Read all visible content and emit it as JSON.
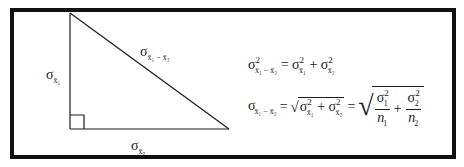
{
  "diagram": {
    "type": "right-triangle",
    "frame_color": "#111111",
    "line_color": "#1a1a1a",
    "vertices": {
      "top": [
        70,
        13
      ],
      "right_angle": [
        70,
        129
      ],
      "bottom_right": [
        229,
        129
      ]
    },
    "labels": {
      "vertical_leg": {
        "symbol": "σ",
        "subscript": "x̄₁",
        "text": "σx̄1"
      },
      "horizontal_leg": {
        "symbol": "σ",
        "subscript": "x̄₂",
        "text": "σx̄2"
      },
      "hypotenuse": {
        "symbol": "σ",
        "subscript": "x̄₁ − x̄₂",
        "text": "σx̄1−x̄2"
      }
    },
    "right_angle_marker": true
  },
  "equations": [
    {
      "id": "variance-sum",
      "text": "σ²(x̄₁−x̄₂) = σ²(x̄₁) + σ²(x̄₂)",
      "lhs": {
        "sym": "σ",
        "sup": "2",
        "sub": "x̄₁ − x̄₂"
      },
      "op": "=",
      "rhs": [
        {
          "sym": "σ",
          "sup": "2",
          "sub": "x̄₁"
        },
        {
          "op": "+"
        },
        {
          "sym": "σ",
          "sup": "2",
          "sub": "x̄₂"
        }
      ]
    },
    {
      "id": "standard-error",
      "text": "σ(x̄₁−x̄₂) = √(σ²(x̄₁) + σ²(x̄₂)) = √(σ₁²/n₁ + σ₂²/n₂)",
      "lhs": {
        "sym": "σ",
        "sub": "x̄₁ − x̄₂"
      },
      "op1": "=",
      "mid_sqrt": [
        {
          "sym": "σ",
          "sup": "2",
          "sub": "x̄₁"
        },
        {
          "op": "+"
        },
        {
          "sym": "σ",
          "sup": "2",
          "sub": "x̄₂"
        }
      ],
      "op2": "=",
      "right_sqrt": [
        {
          "num": "σ₁²",
          "num_sym": "σ",
          "num_sub": "1",
          "num_sup": "2",
          "den": "n₁",
          "den_sym": "n",
          "den_sub": "1"
        },
        {
          "op": "+"
        },
        {
          "num": "σ₂²",
          "num_sym": "σ",
          "num_sub": "2",
          "num_sup": "2",
          "den": "n₂",
          "den_sym": "n",
          "den_sub": "2"
        }
      ]
    }
  ],
  "glyphs": {
    "sigma": "σ",
    "two": "2",
    "eq": "=",
    "plus": "+",
    "minus": "−",
    "xbar1": "x̄₁",
    "xbar2": "x̄₂",
    "diff": "x̄₁ − x̄₂",
    "n": "n",
    "one": "1"
  }
}
